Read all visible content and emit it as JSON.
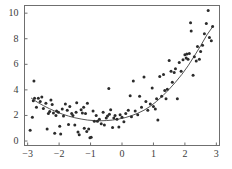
{
  "chart_data": {
    "type": "scatter",
    "title": "",
    "subtitle": "",
    "xlabel": "",
    "ylabel": "",
    "xlim": [
      -3.1,
      3.1
    ],
    "ylim": [
      -0.35,
      10.6
    ],
    "grid": false,
    "legend": null,
    "frame": true,
    "colors": {
      "point": "#2b2b2b",
      "curve": "#555555",
      "axis": "#6f6f6f",
      "text": "#3b3b3b",
      "background": "#ffffff"
    },
    "marker": {
      "shape": "circle",
      "size_px": 3.0
    },
    "curve": {
      "name": "fitted curve",
      "style": "solid",
      "width_px": 1.0,
      "x": [
        -2.88,
        -2.7,
        -2.5,
        -2.3,
        -2.1,
        -1.9,
        -1.7,
        -1.5,
        -1.3,
        -1.1,
        -0.9,
        -0.7,
        -0.5,
        -0.3,
        -0.1,
        0.1,
        0.3,
        0.5,
        0.7,
        0.9,
        1.1,
        1.3,
        1.5,
        1.7,
        1.9,
        2.1,
        2.3,
        2.5,
        2.7,
        2.9
      ],
      "y": [
        3.35,
        3.05,
        2.77,
        2.52,
        2.3,
        2.11,
        1.95,
        1.82,
        1.72,
        1.64,
        1.6,
        1.58,
        1.6,
        1.64,
        1.72,
        1.83,
        1.98,
        2.17,
        2.41,
        2.72,
        3.1,
        3.55,
        4.05,
        4.6,
        5.2,
        5.88,
        6.65,
        7.45,
        8.3,
        9.0
      ]
    },
    "x_ticks": [
      {
        "value": -3,
        "label": "−3"
      },
      {
        "value": -2,
        "label": "−2"
      },
      {
        "value": -1,
        "label": "−1"
      },
      {
        "value": 0,
        "label": "0"
      },
      {
        "value": 1,
        "label": "1"
      },
      {
        "value": 2,
        "label": "2"
      },
      {
        "value": 3,
        "label": "3"
      }
    ],
    "y_ticks": [
      {
        "value": 0,
        "label": "0"
      },
      {
        "value": 2,
        "label": "2"
      },
      {
        "value": 4,
        "label": "4"
      },
      {
        "value": 6,
        "label": "6"
      },
      {
        "value": 8,
        "label": "8"
      },
      {
        "value": 10,
        "label": "10"
      }
    ],
    "points": [
      [
        -2.92,
        0.85
      ],
      [
        -2.85,
        1.85
      ],
      [
        -2.82,
        3.15
      ],
      [
        -2.8,
        4.7
      ],
      [
        -2.78,
        3.35
      ],
      [
        -2.72,
        2.65
      ],
      [
        -2.66,
        3.35
      ],
      [
        -2.6,
        3.1
      ],
      [
        -2.55,
        3.45
      ],
      [
        -2.5,
        2.55
      ],
      [
        -2.42,
        2.95
      ],
      [
        -2.38,
        0.95
      ],
      [
        -2.34,
        2.15
      ],
      [
        -2.3,
        2.3
      ],
      [
        -2.26,
        3.2
      ],
      [
        -2.22,
        2.85
      ],
      [
        -2.18,
        2.2
      ],
      [
        -2.14,
        0.6
      ],
      [
        -2.1,
        2.0
      ],
      [
        -2.08,
        2.35
      ],
      [
        -2.02,
        2.25
      ],
      [
        -1.98,
        1.15
      ],
      [
        -1.95,
        0.55
      ],
      [
        -1.9,
        2.5
      ],
      [
        -1.86,
        1.95
      ],
      [
        -1.8,
        2.9
      ],
      [
        -1.74,
        2.4
      ],
      [
        -1.7,
        1.3
      ],
      [
        -1.66,
        2.7
      ],
      [
        -1.6,
        2.15
      ],
      [
        -1.56,
        2.0
      ],
      [
        -1.5,
        1.25
      ],
      [
        -1.46,
        2.25
      ],
      [
        -1.44,
        3.0
      ],
      [
        -1.4,
        0.7
      ],
      [
        -1.36,
        0.5
      ],
      [
        -1.3,
        2.45
      ],
      [
        -1.26,
        2.2
      ],
      [
        -1.22,
        2.65
      ],
      [
        -1.2,
        1.0
      ],
      [
        -1.16,
        2.15
      ],
      [
        -1.12,
        0.75
      ],
      [
        -1.1,
        2.95
      ],
      [
        -1.06,
        0.95
      ],
      [
        -1.02,
        0.25
      ],
      [
        -0.98,
        0.3
      ],
      [
        -0.92,
        2.35
      ],
      [
        -0.88,
        1.55
      ],
      [
        -0.82,
        2.0
      ],
      [
        -0.78,
        1.55
      ],
      [
        -0.72,
        1.7
      ],
      [
        -0.66,
        1.35
      ],
      [
        -0.6,
        2.25
      ],
      [
        -0.56,
        1.25
      ],
      [
        -0.5,
        1.8
      ],
      [
        -0.46,
        1.95
      ],
      [
        -0.42,
        4.1
      ],
      [
        -0.4,
        2.1
      ],
      [
        -0.36,
        2.45
      ],
      [
        -0.3,
        1.05
      ],
      [
        -0.26,
        1.8
      ],
      [
        -0.22,
        2.0
      ],
      [
        -0.16,
        1.7
      ],
      [
        -0.1,
        1.1
      ],
      [
        -0.06,
        2.05
      ],
      [
        0.0,
        1.85
      ],
      [
        0.06,
        1.5
      ],
      [
        0.12,
        2.15
      ],
      [
        0.2,
        2.4
      ],
      [
        0.26,
        3.55
      ],
      [
        0.3,
        1.9
      ],
      [
        0.36,
        4.7
      ],
      [
        0.42,
        2.35
      ],
      [
        0.5,
        2.05
      ],
      [
        0.56,
        3.5
      ],
      [
        0.62,
        2.65
      ],
      [
        0.7,
        5.0
      ],
      [
        0.76,
        3.1
      ],
      [
        0.82,
        2.4
      ],
      [
        0.9,
        2.9
      ],
      [
        0.96,
        4.15
      ],
      [
        1.0,
        2.7
      ],
      [
        1.06,
        2.5
      ],
      [
        1.1,
        3.3
      ],
      [
        1.14,
        1.65
      ],
      [
        1.2,
        5.05
      ],
      [
        1.26,
        3.5
      ],
      [
        1.32,
        5.2
      ],
      [
        1.36,
        3.95
      ],
      [
        1.4,
        3.3
      ],
      [
        1.44,
        4.05
      ],
      [
        1.5,
        6.3
      ],
      [
        1.56,
        5.45
      ],
      [
        1.6,
        4.6
      ],
      [
        1.66,
        5.35
      ],
      [
        1.7,
        5.65
      ],
      [
        1.76,
        3.3
      ],
      [
        1.82,
        6.15
      ],
      [
        1.88,
        5.45
      ],
      [
        1.94,
        6.35
      ],
      [
        2.0,
        6.75
      ],
      [
        2.04,
        6.5
      ],
      [
        2.06,
        6.8
      ],
      [
        2.1,
        6.4
      ],
      [
        2.14,
        6.85
      ],
      [
        2.18,
        9.25
      ],
      [
        2.2,
        8.6
      ],
      [
        2.26,
        5.15
      ],
      [
        2.3,
        6.6
      ],
      [
        2.36,
        6.25
      ],
      [
        2.4,
        7.4
      ],
      [
        2.46,
        6.4
      ],
      [
        2.5,
        7.0
      ],
      [
        2.56,
        7.5
      ],
      [
        2.62,
        8.4
      ],
      [
        2.68,
        9.2
      ],
      [
        2.74,
        10.2
      ],
      [
        2.78,
        8.1
      ],
      [
        2.84,
        7.85
      ],
      [
        2.88,
        8.95
      ]
    ]
  }
}
